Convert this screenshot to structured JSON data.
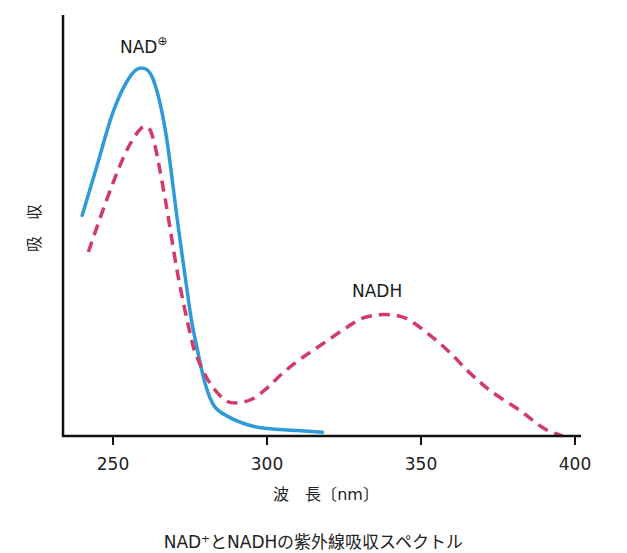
{
  "chart_data": {
    "type": "line",
    "title": "",
    "caption": "NAD⁺とNADHの紫外線吸収スペクトル",
    "xlabel": "波　長〔nm〕",
    "ylabel": "吸　収",
    "xlim": [
      236,
      402
    ],
    "ylim": [
      0,
      1.15
    ],
    "x_ticks": [
      250,
      300,
      350,
      400
    ],
    "y_ticks": [],
    "grid": false,
    "legend": "inline labels",
    "series": [
      {
        "name": "NAD⁺",
        "label_text": "NAD",
        "label_sup": "⊕",
        "style": "solid",
        "color": "#2e9ad8",
        "x": [
          240,
          245,
          250,
          255,
          259,
          263,
          267,
          271,
          275,
          277,
          280,
          283,
          288,
          294,
          300,
          310,
          318
        ],
        "y": [
          0.6,
          0.74,
          0.88,
          0.97,
          1.0,
          0.97,
          0.83,
          0.58,
          0.34,
          0.25,
          0.14,
          0.08,
          0.05,
          0.03,
          0.02,
          0.015,
          0.01
        ]
      },
      {
        "name": "NADH",
        "label_text": "NADH",
        "label_sup": "",
        "style": "dashed",
        "color": "#d23a6a",
        "x": [
          242,
          247,
          252,
          256,
          260,
          263,
          267,
          271,
          275,
          277,
          281,
          286,
          290,
          295,
          300,
          305,
          311,
          318,
          325,
          331,
          338,
          345,
          352,
          359,
          366,
          373,
          382,
          390,
          396
        ],
        "y": [
          0.5,
          0.62,
          0.73,
          0.8,
          0.84,
          0.81,
          0.64,
          0.44,
          0.28,
          0.22,
          0.15,
          0.1,
          0.09,
          0.1,
          0.13,
          0.17,
          0.21,
          0.25,
          0.29,
          0.32,
          0.33,
          0.32,
          0.28,
          0.23,
          0.17,
          0.12,
          0.07,
          0.02,
          0.0
        ]
      }
    ]
  }
}
